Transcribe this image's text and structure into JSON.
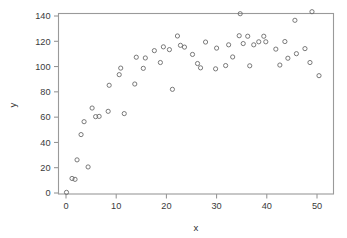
{
  "chart_data": {
    "type": "scatter",
    "title": "",
    "xlabel": "x",
    "ylabel": "y",
    "xlim": [
      -1.5,
      53
    ],
    "ylim": [
      -6,
      148
    ],
    "xticks": [
      0,
      10,
      20,
      30,
      40,
      50
    ],
    "yticks": [
      0,
      20,
      40,
      60,
      80,
      100,
      120,
      140
    ],
    "grid": false,
    "legend": null,
    "marker": "open-circle",
    "marker_color": "#6b6b6b",
    "n_points": 62,
    "x": [
      0.1,
      1.2,
      1.8,
      2.2,
      3.0,
      3.6,
      4.4,
      5.2,
      5.9,
      6.6,
      8.4,
      10.6,
      10.9,
      11.6,
      13.7,
      15.4,
      15.8,
      17.6,
      18.8,
      21.2,
      21.3,
      21.6,
      22.2,
      22.8,
      23.6,
      25.2,
      26.2,
      26.8,
      27.8,
      29.8,
      30.0,
      31.8,
      32.4,
      33.2,
      34.5,
      34.7,
      35.3,
      36.2,
      36.6,
      37.4,
      38.4,
      39.4,
      39.8,
      41.8,
      42.6,
      43.6,
      44.2,
      45.6,
      45.9,
      47.6,
      48.6,
      49.0,
      49.4,
      50.4
    ],
    "y": [
      0.5,
      11.5,
      10.8,
      26.2,
      46.2,
      56.4,
      20.6,
      67.2,
      60.4,
      60.6,
      64.6,
      85.2,
      93.6,
      98.8,
      62.8,
      86.2,
      107.4,
      98.6,
      106.8,
      112.6,
      103.2,
      115.6,
      113.4,
      82.0,
      124.2,
      116.8,
      115.4,
      109.6,
      102.4,
      99.0,
      119.4,
      98.2,
      114.6,
      100.8,
      117.2,
      141.8,
      107.6,
      124.4,
      118.2,
      124.0,
      100.6,
      117.2,
      119.6,
      113.8,
      101.2,
      119.8,
      106.6,
      136.6,
      110.2,
      114.2,
      143.4,
      103.2,
      92.8,
      92.8
    ],
    "points": [
      {
        "x": 0.1,
        "y": 0.5
      },
      {
        "x": 1.2,
        "y": 11.5
      },
      {
        "x": 1.8,
        "y": 10.8
      },
      {
        "x": 2.2,
        "y": 26.2
      },
      {
        "x": 3.0,
        "y": 46.2
      },
      {
        "x": 3.6,
        "y": 56.4
      },
      {
        "x": 4.4,
        "y": 20.6
      },
      {
        "x": 5.2,
        "y": 67.2
      },
      {
        "x": 5.9,
        "y": 60.4
      },
      {
        "x": 6.6,
        "y": 60.6
      },
      {
        "x": 8.4,
        "y": 64.6
      },
      {
        "x": 8.6,
        "y": 85.2
      },
      {
        "x": 10.6,
        "y": 93.6
      },
      {
        "x": 10.9,
        "y": 98.8
      },
      {
        "x": 11.6,
        "y": 62.8
      },
      {
        "x": 13.7,
        "y": 86.2
      },
      {
        "x": 14.0,
        "y": 107.4
      },
      {
        "x": 15.4,
        "y": 98.6
      },
      {
        "x": 15.8,
        "y": 106.8
      },
      {
        "x": 17.6,
        "y": 112.6
      },
      {
        "x": 18.8,
        "y": 103.2
      },
      {
        "x": 19.4,
        "y": 115.6
      },
      {
        "x": 20.6,
        "y": 113.4
      },
      {
        "x": 21.2,
        "y": 82.0
      },
      {
        "x": 22.2,
        "y": 124.2
      },
      {
        "x": 22.8,
        "y": 116.8
      },
      {
        "x": 23.6,
        "y": 115.4
      },
      {
        "x": 25.2,
        "y": 109.6
      },
      {
        "x": 26.2,
        "y": 102.4
      },
      {
        "x": 26.8,
        "y": 99.0
      },
      {
        "x": 27.8,
        "y": 119.4
      },
      {
        "x": 29.8,
        "y": 98.2
      },
      {
        "x": 30.0,
        "y": 114.6
      },
      {
        "x": 31.8,
        "y": 100.8
      },
      {
        "x": 32.4,
        "y": 117.2
      },
      {
        "x": 33.2,
        "y": 107.6
      },
      {
        "x": 34.5,
        "y": 124.4
      },
      {
        "x": 34.7,
        "y": 141.8
      },
      {
        "x": 35.3,
        "y": 118.2
      },
      {
        "x": 36.2,
        "y": 124.0
      },
      {
        "x": 36.6,
        "y": 100.6
      },
      {
        "x": 37.4,
        "y": 117.2
      },
      {
        "x": 38.4,
        "y": 119.6
      },
      {
        "x": 39.4,
        "y": 124.0
      },
      {
        "x": 39.8,
        "y": 119.6
      },
      {
        "x": 41.8,
        "y": 113.8
      },
      {
        "x": 42.6,
        "y": 101.2
      },
      {
        "x": 43.6,
        "y": 119.8
      },
      {
        "x": 44.2,
        "y": 106.6
      },
      {
        "x": 45.6,
        "y": 136.6
      },
      {
        "x": 45.9,
        "y": 110.2
      },
      {
        "x": 47.6,
        "y": 114.2
      },
      {
        "x": 48.6,
        "y": 103.2
      },
      {
        "x": 49.0,
        "y": 143.4
      },
      {
        "x": 50.4,
        "y": 92.8
      }
    ]
  },
  "axes": {
    "x_title": "x",
    "y_title": "y",
    "x_tick_labels": [
      "0",
      "10",
      "20",
      "30",
      "40",
      "50"
    ],
    "y_tick_labels": [
      "0",
      "20",
      "40",
      "60",
      "80",
      "100",
      "120",
      "140"
    ]
  },
  "colors": {
    "frame": "#9a9a9a",
    "tick": "#8e8e8e",
    "text": "#3a3a3a",
    "marker": "#6b6b6b",
    "background": "#ffffff"
  }
}
